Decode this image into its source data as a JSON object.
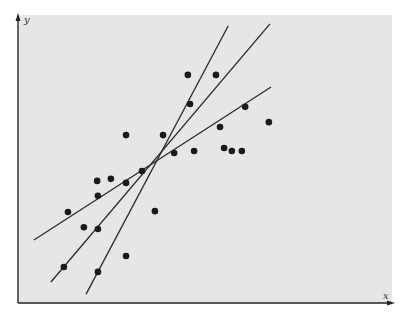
{
  "chart_data": {
    "type": "scatter",
    "title": "",
    "xlabel": "x",
    "ylabel": "y",
    "xlim": [
      0,
      10
    ],
    "ylim": [
      0,
      10
    ],
    "grid": false,
    "legend": null,
    "background": "#e6e6e6",
    "point_color": "#1a1a1a",
    "line_color": "#2a2a2a",
    "series": [
      {
        "name": "points",
        "type": "scatter",
        "points": [
          [
            1.35,
            3.16
          ],
          [
            1.78,
            2.63
          ],
          [
            2.16,
            3.72
          ],
          [
            2.14,
            4.24
          ],
          [
            1.24,
            1.25
          ],
          [
            2.16,
            2.57
          ],
          [
            2.16,
            1.08
          ],
          [
            2.51,
            4.31
          ],
          [
            2.92,
            5.83
          ],
          [
            2.92,
            4.17
          ],
          [
            3.35,
            4.58
          ],
          [
            3.7,
            3.19
          ],
          [
            2.92,
            1.63
          ],
          [
            3.92,
            5.83
          ],
          [
            4.22,
            5.21
          ],
          [
            4.76,
            5.28
          ],
          [
            4.59,
            7.92
          ],
          [
            4.65,
            6.91
          ],
          [
            5.57,
            5.38
          ],
          [
            5.46,
            6.11
          ],
          [
            5.78,
            5.28
          ],
          [
            5.35,
            7.92
          ],
          [
            6.14,
            6.81
          ],
          [
            6.78,
            6.28
          ],
          [
            6.05,
            5.28
          ]
        ]
      },
      {
        "name": "line-shallow",
        "type": "line",
        "x": [
          0.43,
          6.84
        ],
        "y": [
          2.19,
          7.5
        ]
      },
      {
        "name": "line-middle",
        "type": "line",
        "x": [
          0.89,
          6.81
        ],
        "y": [
          0.73,
          9.69
        ]
      },
      {
        "name": "line-steep",
        "type": "line",
        "x": [
          1.84,
          5.68
        ],
        "y": [
          0.31,
          9.62
        ]
      }
    ]
  }
}
